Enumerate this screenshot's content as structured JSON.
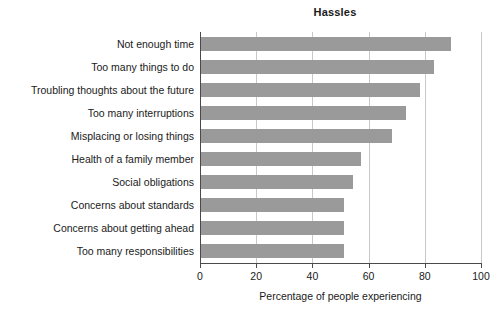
{
  "chart_data": {
    "type": "bar",
    "orientation": "horizontal",
    "title": "Hassles",
    "xlabel": "Percentage of people experiencing",
    "ylabel": "",
    "xlim": [
      0,
      100
    ],
    "xticks": [
      "0",
      "20",
      "40",
      "60",
      "80",
      "100"
    ],
    "xtick_values": [
      0,
      20,
      40,
      60,
      80,
      100
    ],
    "grid": "vertical",
    "legend": "none",
    "bar_color": "#9a9a9a",
    "axis_color": "#4a4a4a",
    "gridline_color": "#c8c8c8",
    "categories": [
      "Not enough time",
      "Too many things to do",
      "Troubling thoughts about the future",
      "Too many interruptions",
      "Misplacing or losing things",
      "Health of a family member",
      "Social obligations",
      "Concerns about standards",
      "Concerns about getting ahead",
      "Too many responsibilities"
    ],
    "values": [
      89,
      83,
      78,
      73,
      68,
      57,
      54,
      51,
      51,
      51
    ]
  },
  "footer": {
    "smudge": ""
  }
}
